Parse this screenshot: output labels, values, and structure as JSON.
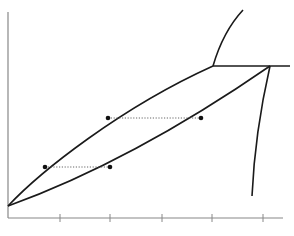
{
  "diagram": {
    "type": "phase-diagram",
    "title": "",
    "labels": [],
    "colors": {
      "axis": "#888888",
      "curve": "#1a1a1a",
      "tie_line": "#555555",
      "point": "#111111",
      "background": "#ffffff"
    },
    "axes": {
      "origin": [
        8,
        218
      ],
      "y_axis_top": [
        8,
        12
      ],
      "x_axis_end": [
        283,
        218
      ],
      "x_ticks": [
        60,
        110,
        162,
        212,
        263
      ]
    },
    "curves": {
      "liquidus": "M8,206 C40,172 120,108 213,66",
      "solidus": "M8,206 C80,180 170,135 270,66",
      "eutectic_line": "M213,66 L290,66",
      "upper_boundary": "M213,66 C220,42 230,24 243,10",
      "solvus": "M270,66 C260,110 254,150 252,196"
    },
    "tie_lines": [
      {
        "x1": 45,
        "y1": 167,
        "x2": 110,
        "y2": 167
      },
      {
        "x1": 108,
        "y1": 118,
        "x2": 201,
        "y2": 118
      }
    ],
    "points": [
      {
        "x": 45,
        "y": 167
      },
      {
        "x": 110,
        "y": 167
      },
      {
        "x": 108,
        "y": 118
      },
      {
        "x": 201,
        "y": 118
      }
    ]
  }
}
